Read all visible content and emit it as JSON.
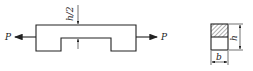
{
  "diagram": {
    "left_figure": {
      "description": "Notched bar under axial tension",
      "load_left_label": "P",
      "load_right_label": "P",
      "notch_depth_label": "h/2"
    },
    "cross_section": {
      "width_label": "b",
      "height_label": "h",
      "hatched_region": "upper half"
    },
    "colors": {
      "line": "#222222",
      "background": "#ffffff"
    }
  }
}
